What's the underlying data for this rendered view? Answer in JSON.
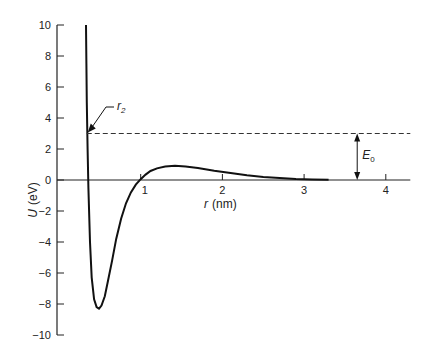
{
  "chart_data": {
    "type": "line",
    "title": "",
    "xlabel": "r (nm)",
    "xlabel_var": "r",
    "xlabel_unit": "(nm)",
    "ylabel": "U (eV)",
    "ylabel_var": "U",
    "ylabel_unit": "(eV)",
    "xlim": [
      0,
      4.3
    ],
    "ylim": [
      -10,
      10
    ],
    "xticks": [
      1,
      2,
      3,
      4
    ],
    "yticks": [
      10,
      8,
      6,
      4,
      2,
      0,
      -2,
      -4,
      -6,
      -8,
      -10
    ],
    "ytick_labels": [
      "10",
      "8",
      "6",
      "4",
      "2",
      "0",
      "−2",
      "−4",
      "−6",
      "−8",
      "−10"
    ],
    "grid": false,
    "series": [
      {
        "name": "U(r)",
        "x": [
          0.33,
          0.335,
          0.34,
          0.35,
          0.36,
          0.38,
          0.4,
          0.43,
          0.46,
          0.49,
          0.52,
          0.56,
          0.6,
          0.65,
          0.7,
          0.76,
          0.82,
          0.88,
          0.94,
          1.0,
          1.06,
          1.12,
          1.2,
          1.3,
          1.42,
          1.55,
          1.7,
          1.9,
          2.1,
          2.3,
          2.5,
          2.7,
          2.9,
          3.1,
          3.3
        ],
        "y": [
          10,
          7.5,
          5.0,
          2.0,
          -0.5,
          -4.0,
          -6.3,
          -7.7,
          -8.2,
          -8.3,
          -8.1,
          -7.5,
          -6.5,
          -5.2,
          -3.8,
          -2.5,
          -1.5,
          -0.8,
          -0.3,
          0.05,
          0.35,
          0.58,
          0.75,
          0.87,
          0.92,
          0.88,
          0.78,
          0.6,
          0.45,
          0.3,
          0.2,
          0.12,
          0.06,
          0.03,
          0.02
        ]
      }
    ],
    "annotations": {
      "dashed_level": {
        "y": 3.0,
        "from_x": 0.34,
        "to_x": 4.3
      },
      "r2_label": "r",
      "r2_subscript": "2",
      "e0_label": "E",
      "e0_subscript": "0",
      "e0_arrow_x": 3.65
    }
  }
}
